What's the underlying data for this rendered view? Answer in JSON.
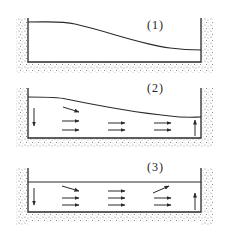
{
  "panels": [
    {
      "label": "(1)",
      "description": "Tank with sloped free surface, no flow arrows"
    },
    {
      "label": "(2)",
      "description": "Tank with sloped surface, downward arrow at left, upward arrow at right, rightward flow arrows"
    },
    {
      "label": "(3)",
      "description": "Tank with flat surface, downward arrow at left, upward arrow at right, rightward flow arrows"
    }
  ],
  "colors": {
    "line": "#2a2a2a",
    "stipple": "#9a9a9a",
    "background": "#ffffff"
  }
}
